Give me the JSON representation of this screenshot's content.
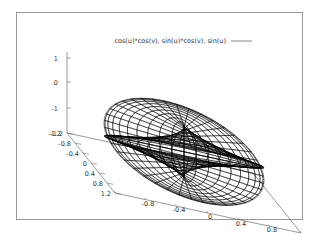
{
  "chart_data": {
    "type": "surface3d",
    "title": "",
    "legend": {
      "entries": [
        "cos(u)*cos(v), sin(u)*cos(v), sin(u)"
      ],
      "position": "top-right",
      "line_color": "#555555"
    },
    "parametric": {
      "x": "cos(u)*cos(v)",
      "y": "sin(u)*cos(v)",
      "z": "sin(u)",
      "u_range": [
        -3.14159,
        3.14159
      ],
      "v_range": [
        -3.14159,
        3.14159
      ],
      "u_isosamples": 40,
      "v_isosamples": 40,
      "style": "wireframe (hidden3d)"
    },
    "axes": {
      "x": {
        "ticks": [
          "-1.2",
          "-0.8",
          "-0.4",
          "0",
          "0.4",
          "0.8",
          "1.2"
        ],
        "range": [
          -1.2,
          1.2
        ]
      },
      "y": {
        "ticks": [
          "-1.2",
          "-0.8",
          "-0.4",
          "0",
          "0.4",
          "0.8",
          "1.2"
        ],
        "range": [
          -1.2,
          1.2
        ]
      },
      "z": {
        "ticks": [
          "1",
          "0",
          "-1",
          "-1.2"
        ],
        "range": [
          -1.2,
          1
        ]
      }
    },
    "view": {
      "rot_x": 60,
      "rot_z": 30
    },
    "grid": false,
    "colors": {
      "surface": "#000000",
      "axes": "#555555",
      "frame": "#9a9a9a"
    }
  }
}
